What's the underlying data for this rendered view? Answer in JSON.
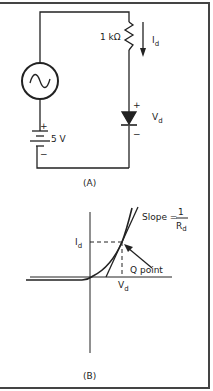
{
  "figure": {
    "panel_a": {
      "caption": "(A)",
      "resistor_label": "1 kΩ",
      "current_label": "I",
      "current_sub": "d",
      "voltage_label": "V",
      "voltage_sub": "d",
      "diode_plus": "+",
      "diode_minus": "−",
      "battery_label": "5 V",
      "battery_plus": "+",
      "battery_minus": "−"
    },
    "panel_b": {
      "caption": "(B)",
      "id_label": "I",
      "id_sub": "d",
      "vd_label": "V",
      "vd_sub": "d",
      "q_point_label": "Q point",
      "slope_label": "Slope =",
      "slope_num": "1",
      "slope_den": "R",
      "slope_den_sub": "d"
    }
  },
  "colors": {
    "line": "#222222",
    "border": "#444444",
    "background": "#ffffff"
  }
}
